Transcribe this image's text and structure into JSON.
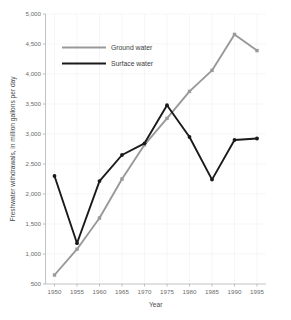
{
  "chart_data": {
    "type": "line",
    "title": "",
    "xlabel": "Year",
    "ylabel": "Freshwater withdrawals, in million gallons per day",
    "x": [
      1950,
      1955,
      1960,
      1965,
      1970,
      1975,
      1980,
      1985,
      1990,
      1995
    ],
    "xticklabels": [
      "1950",
      "1955",
      "1960",
      "1965",
      "1970",
      "1975",
      "1980",
      "1985",
      "1990",
      "1995"
    ],
    "yticks": [
      500,
      1000,
      1500,
      2000,
      2500,
      3000,
      3500,
      4000,
      4500,
      5000
    ],
    "yticklabels": [
      "500",
      "1,000",
      "1,500",
      "2,000",
      "2,500",
      "3,000",
      "3,500",
      "4,000",
      "4,500",
      "5,000"
    ],
    "xlim": [
      1948,
      1997
    ],
    "ylim": [
      500,
      5000
    ],
    "grid": true,
    "legend_position": "upper-left-inside",
    "series": [
      {
        "name": "Ground water",
        "color": "#999999",
        "marker": "square",
        "values": [
          650,
          1080,
          1600,
          2250,
          2820,
          3260,
          3710,
          4060,
          4660,
          4390
        ]
      },
      {
        "name": "Surface water",
        "color": "#1a1a1a",
        "marker": "circle",
        "values": [
          2300,
          1180,
          2215,
          2650,
          2845,
          3480,
          2950,
          2240,
          2900,
          2925
        ]
      }
    ]
  },
  "legend": {
    "items": [
      {
        "label": "Ground water",
        "color": "#999999"
      },
      {
        "label": "Surface water",
        "color": "#1a1a1a"
      }
    ]
  },
  "axes": {
    "x_title": "Year",
    "y_title": "Freshwater withdrawals, in million gallons per day"
  }
}
